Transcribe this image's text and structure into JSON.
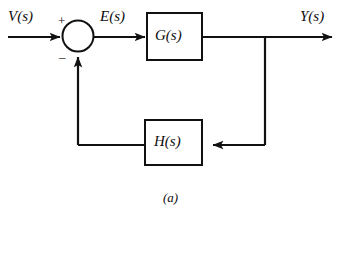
{
  "figure": {
    "caption": "(a)",
    "type": "control-system-block-diagram",
    "line_color": "#111111",
    "background_color": "#ffffff"
  },
  "signals": {
    "input": "V(s)",
    "error": "E(s)",
    "output": "Y(s)"
  },
  "summing_junction": {
    "positive_sign": "+",
    "negative_sign": "–"
  },
  "blocks": [
    {
      "id": "forward",
      "label": "G(s)"
    },
    {
      "id": "feedback",
      "label": "H(s)"
    }
  ]
}
